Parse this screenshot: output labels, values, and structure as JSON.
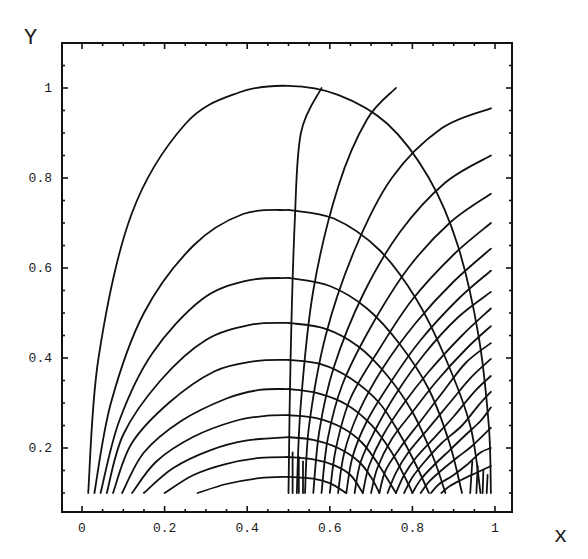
{
  "chart_data": {
    "type": "line",
    "title": "",
    "xlabel": "x",
    "ylabel": "Y",
    "xlim": [
      -0.05,
      1.04
    ],
    "ylim": [
      0.06,
      1.1
    ],
    "x_ticks": [
      0,
      0.2,
      0.4,
      0.6,
      0.8,
      1
    ],
    "x_tick_labels": [
      "0",
      "0.2",
      "0.4",
      "0.6",
      "0.8",
      "1"
    ],
    "y_ticks": [
      0.2,
      0.4,
      0.6,
      0.8,
      1
    ],
    "y_tick_labels": [
      "0.2",
      "0.4",
      "0.6",
      "0.8",
      "1"
    ],
    "grid": false,
    "legend": null,
    "series": [
      {
        "name": "left-arc-1",
        "points": [
          [
            0.015,
            0.1
          ],
          [
            0.04,
            0.4
          ],
          [
            0.12,
            0.72
          ],
          [
            0.25,
            0.92
          ],
          [
            0.38,
            0.99
          ],
          [
            0.5,
            1.005
          ],
          [
            0.62,
            0.985
          ],
          [
            0.74,
            0.92
          ],
          [
            0.84,
            0.8
          ],
          [
            0.91,
            0.65
          ],
          [
            0.96,
            0.45
          ],
          [
            0.985,
            0.25
          ],
          [
            0.99,
            0.1
          ]
        ]
      },
      {
        "name": "left-arc-2",
        "points": [
          [
            0.03,
            0.1
          ],
          [
            0.07,
            0.3
          ],
          [
            0.15,
            0.5
          ],
          [
            0.27,
            0.65
          ],
          [
            0.39,
            0.72
          ],
          [
            0.5,
            0.729
          ]
        ]
      },
      {
        "name": "left-arc-3",
        "points": [
          [
            0.045,
            0.1
          ],
          [
            0.09,
            0.26
          ],
          [
            0.17,
            0.41
          ],
          [
            0.29,
            0.53
          ],
          [
            0.4,
            0.572
          ],
          [
            0.5,
            0.578
          ]
        ]
      },
      {
        "name": "left-arc-4",
        "points": [
          [
            0.06,
            0.1
          ],
          [
            0.1,
            0.23
          ],
          [
            0.19,
            0.35
          ],
          [
            0.3,
            0.44
          ],
          [
            0.41,
            0.474
          ],
          [
            0.5,
            0.478
          ]
        ]
      },
      {
        "name": "left-arc-5",
        "points": [
          [
            0.075,
            0.1
          ],
          [
            0.12,
            0.21
          ],
          [
            0.21,
            0.3
          ],
          [
            0.32,
            0.37
          ],
          [
            0.42,
            0.393
          ],
          [
            0.5,
            0.396
          ]
        ]
      },
      {
        "name": "left-arc-6",
        "points": [
          [
            0.097,
            0.1
          ],
          [
            0.15,
            0.19
          ],
          [
            0.24,
            0.26
          ],
          [
            0.35,
            0.31
          ],
          [
            0.43,
            0.329
          ],
          [
            0.5,
            0.331
          ]
        ]
      },
      {
        "name": "left-arc-7",
        "points": [
          [
            0.121,
            0.1
          ],
          [
            0.18,
            0.17
          ],
          [
            0.27,
            0.225
          ],
          [
            0.37,
            0.26
          ],
          [
            0.44,
            0.271
          ],
          [
            0.5,
            0.273
          ]
        ]
      },
      {
        "name": "left-arc-8",
        "points": [
          [
            0.15,
            0.1
          ],
          [
            0.22,
            0.155
          ],
          [
            0.31,
            0.195
          ],
          [
            0.4,
            0.217
          ],
          [
            0.5,
            0.224
          ]
        ]
      },
      {
        "name": "left-arc-9",
        "points": [
          [
            0.2,
            0.1
          ],
          [
            0.27,
            0.14
          ],
          [
            0.35,
            0.165
          ],
          [
            0.43,
            0.178
          ],
          [
            0.5,
            0.18
          ]
        ]
      },
      {
        "name": "left-arc-10",
        "points": [
          [
            0.28,
            0.1
          ],
          [
            0.35,
            0.12
          ],
          [
            0.43,
            0.133
          ],
          [
            0.5,
            0.136
          ]
        ]
      },
      {
        "name": "right-arc-1",
        "points": [
          [
            0.5,
            0.729
          ],
          [
            0.61,
            0.71
          ],
          [
            0.72,
            0.64
          ],
          [
            0.81,
            0.53
          ],
          [
            0.88,
            0.4
          ],
          [
            0.94,
            0.25
          ],
          [
            0.965,
            0.1
          ]
        ]
      },
      {
        "name": "right-arc-2",
        "points": [
          [
            0.5,
            0.578
          ],
          [
            0.6,
            0.56
          ],
          [
            0.69,
            0.51
          ],
          [
            0.77,
            0.43
          ],
          [
            0.84,
            0.33
          ],
          [
            0.89,
            0.21
          ],
          [
            0.92,
            0.1
          ]
        ]
      },
      {
        "name": "right-arc-3",
        "points": [
          [
            0.5,
            0.478
          ],
          [
            0.59,
            0.465
          ],
          [
            0.67,
            0.425
          ],
          [
            0.74,
            0.36
          ],
          [
            0.8,
            0.28
          ],
          [
            0.85,
            0.18
          ],
          [
            0.88,
            0.1
          ]
        ]
      },
      {
        "name": "right-arc-4",
        "points": [
          [
            0.5,
            0.396
          ],
          [
            0.58,
            0.386
          ],
          [
            0.65,
            0.355
          ],
          [
            0.72,
            0.3
          ],
          [
            0.77,
            0.23
          ],
          [
            0.81,
            0.16
          ],
          [
            0.84,
            0.1
          ]
        ]
      },
      {
        "name": "right-arc-5",
        "points": [
          [
            0.5,
            0.331
          ],
          [
            0.57,
            0.322
          ],
          [
            0.64,
            0.297
          ],
          [
            0.7,
            0.252
          ],
          [
            0.75,
            0.19
          ],
          [
            0.79,
            0.12
          ],
          [
            0.8,
            0.1
          ]
        ]
      },
      {
        "name": "right-arc-6",
        "points": [
          [
            0.5,
            0.273
          ],
          [
            0.57,
            0.266
          ],
          [
            0.63,
            0.245
          ],
          [
            0.68,
            0.21
          ],
          [
            0.72,
            0.16
          ],
          [
            0.76,
            0.1
          ]
        ]
      },
      {
        "name": "right-arc-7",
        "points": [
          [
            0.5,
            0.224
          ],
          [
            0.56,
            0.218
          ],
          [
            0.62,
            0.2
          ],
          [
            0.67,
            0.17
          ],
          [
            0.7,
            0.135
          ],
          [
            0.72,
            0.1
          ]
        ]
      },
      {
        "name": "right-arc-8",
        "points": [
          [
            0.5,
            0.18
          ],
          [
            0.56,
            0.175
          ],
          [
            0.61,
            0.162
          ],
          [
            0.65,
            0.14
          ],
          [
            0.68,
            0.1
          ]
        ]
      },
      {
        "name": "right-arc-9",
        "points": [
          [
            0.5,
            0.136
          ],
          [
            0.56,
            0.132
          ],
          [
            0.6,
            0.122
          ],
          [
            0.64,
            0.1
          ]
        ]
      },
      {
        "name": "radial-1",
        "points": [
          [
            0.5,
            0.1
          ],
          [
            0.505,
            0.4
          ],
          [
            0.515,
            0.7
          ],
          [
            0.53,
            0.9
          ],
          [
            0.58,
            1.0
          ]
        ]
      },
      {
        "name": "radial-2",
        "points": [
          [
            0.52,
            0.1
          ],
          [
            0.53,
            0.3
          ],
          [
            0.56,
            0.55
          ],
          [
            0.62,
            0.78
          ],
          [
            0.69,
            0.93
          ],
          [
            0.76,
            1.0
          ]
        ]
      },
      {
        "name": "radial-3",
        "points": [
          [
            0.54,
            0.1
          ],
          [
            0.55,
            0.25
          ],
          [
            0.59,
            0.45
          ],
          [
            0.66,
            0.64
          ],
          [
            0.75,
            0.8
          ],
          [
            0.87,
            0.91
          ],
          [
            0.99,
            0.955
          ]
        ]
      },
      {
        "name": "radial-4",
        "points": [
          [
            0.56,
            0.1
          ],
          [
            0.575,
            0.24
          ],
          [
            0.61,
            0.38
          ],
          [
            0.68,
            0.54
          ],
          [
            0.77,
            0.68
          ],
          [
            0.88,
            0.79
          ],
          [
            0.99,
            0.85
          ]
        ]
      },
      {
        "name": "radial-5",
        "points": [
          [
            0.58,
            0.1
          ],
          [
            0.595,
            0.22
          ],
          [
            0.63,
            0.34
          ],
          [
            0.7,
            0.47
          ],
          [
            0.79,
            0.6
          ],
          [
            0.89,
            0.7
          ],
          [
            0.99,
            0.765
          ]
        ]
      },
      {
        "name": "radial-6",
        "points": [
          [
            0.6,
            0.1
          ],
          [
            0.615,
            0.2
          ],
          [
            0.65,
            0.31
          ],
          [
            0.72,
            0.42
          ],
          [
            0.8,
            0.53
          ],
          [
            0.9,
            0.63
          ],
          [
            0.99,
            0.7
          ]
        ]
      },
      {
        "name": "radial-7",
        "points": [
          [
            0.62,
            0.1
          ],
          [
            0.635,
            0.19
          ],
          [
            0.67,
            0.28
          ],
          [
            0.73,
            0.38
          ],
          [
            0.81,
            0.48
          ],
          [
            0.9,
            0.57
          ],
          [
            0.99,
            0.643
          ]
        ]
      },
      {
        "name": "radial-8",
        "points": [
          [
            0.64,
            0.1
          ],
          [
            0.655,
            0.18
          ],
          [
            0.69,
            0.26
          ],
          [
            0.75,
            0.35
          ],
          [
            0.82,
            0.44
          ],
          [
            0.91,
            0.53
          ],
          [
            0.99,
            0.594
          ]
        ]
      },
      {
        "name": "radial-9",
        "points": [
          [
            0.66,
            0.1
          ],
          [
            0.675,
            0.17
          ],
          [
            0.71,
            0.24
          ],
          [
            0.76,
            0.32
          ],
          [
            0.83,
            0.41
          ],
          [
            0.91,
            0.49
          ],
          [
            0.99,
            0.547
          ]
        ]
      },
      {
        "name": "radial-10",
        "points": [
          [
            0.68,
            0.1
          ],
          [
            0.695,
            0.16
          ],
          [
            0.73,
            0.23
          ],
          [
            0.78,
            0.3
          ],
          [
            0.84,
            0.37
          ],
          [
            0.92,
            0.45
          ],
          [
            0.99,
            0.51
          ]
        ]
      },
      {
        "name": "radial-11",
        "points": [
          [
            0.7,
            0.1
          ],
          [
            0.715,
            0.155
          ],
          [
            0.75,
            0.22
          ],
          [
            0.8,
            0.28
          ],
          [
            0.86,
            0.35
          ],
          [
            0.93,
            0.42
          ],
          [
            0.99,
            0.471
          ]
        ]
      },
      {
        "name": "radial-12",
        "points": [
          [
            0.72,
            0.1
          ],
          [
            0.735,
            0.15
          ],
          [
            0.77,
            0.2
          ],
          [
            0.82,
            0.26
          ],
          [
            0.87,
            0.32
          ],
          [
            0.93,
            0.39
          ],
          [
            0.99,
            0.433
          ]
        ]
      },
      {
        "name": "radial-13",
        "points": [
          [
            0.74,
            0.1
          ],
          [
            0.76,
            0.145
          ],
          [
            0.79,
            0.19
          ],
          [
            0.84,
            0.245
          ],
          [
            0.89,
            0.3
          ],
          [
            0.94,
            0.355
          ],
          [
            0.99,
            0.398
          ]
        ]
      },
      {
        "name": "radial-14",
        "points": [
          [
            0.76,
            0.1
          ],
          [
            0.78,
            0.14
          ],
          [
            0.81,
            0.18
          ],
          [
            0.855,
            0.225
          ],
          [
            0.9,
            0.27
          ],
          [
            0.95,
            0.325
          ],
          [
            0.99,
            0.36
          ]
        ]
      },
      {
        "name": "radial-15",
        "points": [
          [
            0.78,
            0.1
          ],
          [
            0.8,
            0.135
          ],
          [
            0.83,
            0.17
          ],
          [
            0.87,
            0.21
          ],
          [
            0.92,
            0.25
          ],
          [
            0.96,
            0.295
          ],
          [
            0.99,
            0.325
          ]
        ]
      },
      {
        "name": "radial-16",
        "points": [
          [
            0.8,
            0.1
          ],
          [
            0.82,
            0.13
          ],
          [
            0.85,
            0.16
          ],
          [
            0.89,
            0.195
          ],
          [
            0.93,
            0.23
          ],
          [
            0.965,
            0.26
          ],
          [
            0.99,
            0.29
          ]
        ]
      },
      {
        "name": "radial-17",
        "points": [
          [
            0.82,
            0.1
          ],
          [
            0.84,
            0.125
          ],
          [
            0.87,
            0.15
          ],
          [
            0.91,
            0.18
          ],
          [
            0.945,
            0.205
          ],
          [
            0.99,
            0.245
          ]
        ]
      },
      {
        "name": "radial-18",
        "points": [
          [
            0.845,
            0.1
          ],
          [
            0.865,
            0.12
          ],
          [
            0.9,
            0.14
          ],
          [
            0.935,
            0.165
          ],
          [
            0.965,
            0.19
          ],
          [
            0.99,
            0.2
          ]
        ]
      },
      {
        "name": "radial-19",
        "points": [
          [
            0.87,
            0.1
          ],
          [
            0.89,
            0.115
          ],
          [
            0.92,
            0.13
          ],
          [
            0.955,
            0.145
          ],
          [
            0.99,
            0.16
          ]
        ]
      },
      {
        "name": "vertical-left-1",
        "points": [
          [
            0.51,
            0.1
          ],
          [
            0.51,
            0.19
          ]
        ]
      },
      {
        "name": "vertical-left-2",
        "points": [
          [
            0.525,
            0.1
          ],
          [
            0.525,
            0.18
          ]
        ]
      },
      {
        "name": "vertical-left-3",
        "points": [
          [
            0.535,
            0.1
          ],
          [
            0.535,
            0.17
          ]
        ]
      },
      {
        "name": "vertical-right-1",
        "points": [
          [
            0.94,
            0.1
          ],
          [
            0.945,
            0.17
          ]
        ]
      },
      {
        "name": "vertical-right-2",
        "points": [
          [
            0.955,
            0.1
          ],
          [
            0.958,
            0.16
          ]
        ]
      },
      {
        "name": "vertical-right-3",
        "points": [
          [
            0.97,
            0.1
          ],
          [
            0.972,
            0.15
          ]
        ]
      },
      {
        "name": "vertical-right-4",
        "points": [
          [
            0.98,
            0.1
          ],
          [
            0.982,
            0.14
          ]
        ]
      }
    ]
  },
  "axes": {
    "x_title": "x",
    "y_title": "Y"
  }
}
